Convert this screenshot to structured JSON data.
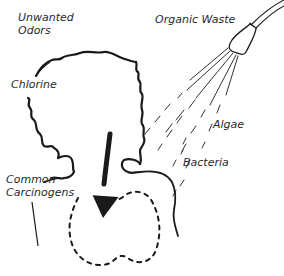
{
  "labels": {
    "unwanted_odors_line1": "Unwanted",
    "unwanted_odors_line2": "Odors",
    "organic_waste": "Organic Waste",
    "chlorine": "Chlorine",
    "algae": "Algae",
    "bacteria": "Bacteria",
    "common_carcinogens_line1": "Common",
    "common_carcinogens_line2": "Carcinogens"
  },
  "colors": {
    "ink": "#1a1a1a",
    "text": "#2a2a2a",
    "background": "#ffffff"
  }
}
